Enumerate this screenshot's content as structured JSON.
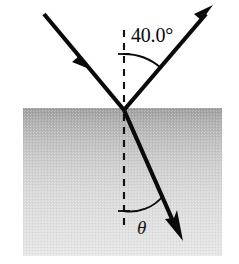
{
  "figure": {
    "canvas": {
      "width": 239,
      "height": 264,
      "background": "#ffffff"
    },
    "ghost_header": "",
    "medium": {
      "name": "denser-medium-block",
      "x": 23,
      "y": 108,
      "width": 199,
      "height": 148,
      "gradient_top_color": "#a3a3a3",
      "gradient_bottom_color": "#e4e4e4"
    },
    "surface": {
      "name": "interface-surface",
      "y": 108,
      "x_start": 23,
      "x_end": 222
    },
    "incidence_point": {
      "x": 124,
      "y": 110
    },
    "normal": {
      "label": "normal-line",
      "x": 124,
      "y_top": 30,
      "y_bottom": 228,
      "style": "dashed"
    },
    "rays": [
      {
        "name": "incident-ray",
        "from": {
          "x": 44,
          "y": 14
        },
        "to": {
          "x": 124,
          "y": 110
        },
        "arrow_at": {
          "x": 88,
          "y": 66
        },
        "direction": "toward-surface",
        "color": "#0a0a0a"
      },
      {
        "name": "reflected-ray",
        "from": {
          "x": 124,
          "y": 110
        },
        "to": {
          "x": 211,
          "y": 8
        },
        "arrow_at": {
          "x": 211,
          "y": 8
        },
        "direction": "away-from-surface",
        "color": "#0a0a0a"
      },
      {
        "name": "refracted-ray",
        "from": {
          "x": 124,
          "y": 110
        },
        "to": {
          "x": 181,
          "y": 237
        },
        "arrow_at": {
          "x": 181,
          "y": 237
        },
        "direction": "into-medium",
        "color": "#0a0a0a"
      }
    ],
    "angles": [
      {
        "name": "reflection-angle",
        "label": "40.0°",
        "value": 40.0,
        "unit": "degrees",
        "measured_from": "normal",
        "side": "above-surface-right",
        "label_x": 131,
        "label_y": 33
      },
      {
        "name": "refraction-angle",
        "label": "θ",
        "value": null,
        "unit": "degrees",
        "measured_from": "normal",
        "side": "below-surface-right",
        "label_x": 143,
        "label_y": 236
      }
    ]
  }
}
